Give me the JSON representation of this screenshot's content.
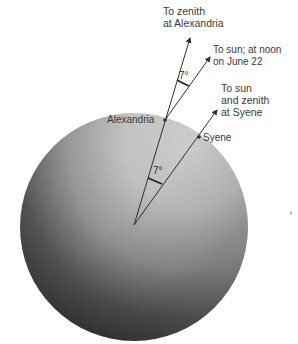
{
  "diagram": {
    "labels": {
      "zenith_alexandria": [
        "To zenith",
        "at Alexandria"
      ],
      "sun_noon": [
        "To sun; at noon",
        "on June 22"
      ],
      "sun_syene": [
        "To sun",
        "and zenith",
        "at Syene"
      ],
      "alexandria": "Alexandria",
      "syene": "Syene"
    },
    "angles": {
      "top": "7°",
      "center": "7°"
    },
    "colors": {
      "sphere_light": "#d2d2d2",
      "sphere_mid": "#a8a8a8",
      "sphere_dark": "#383838",
      "line": "#2e2e2e",
      "text": "#3a3a3a",
      "background": "#ffffff"
    }
  }
}
